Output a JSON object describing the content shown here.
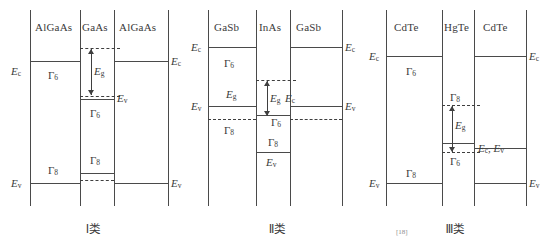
{
  "figure": {
    "line_color": "#4a4a4a",
    "dash_color": "#3f3f3f"
  },
  "panels": [
    {
      "id": "type-1",
      "caption": "Ⅰ类",
      "materials": {
        "barrier_left": "AlGaAs",
        "well": "GaAs",
        "barrier_right": "AlGaAs"
      },
      "labels": {
        "ec_left": "E",
        "ec_left_sub": "c",
        "ec_right": "E",
        "ec_right_sub": "c",
        "ev_left": "E",
        "ev_left_sub": "v",
        "ev_right": "E",
        "ev_right_sub": "v",
        "ev_well": "E",
        "ev_well_sub": "v",
        "eg": "E",
        "eg_sub": "g",
        "gamma_barrier_c": "Γ",
        "gamma_barrier_c_sub": "6",
        "gamma_well_c": "Γ",
        "gamma_well_c_sub": "6",
        "gamma_barrier_v": "Γ",
        "gamma_barrier_v_sub": "8",
        "gamma_well_v": "Γ",
        "gamma_well_v_sub": "8"
      }
    },
    {
      "id": "type-2",
      "caption": "Ⅱ类",
      "materials": {
        "barrier_left": "GaSb",
        "well": "InAs",
        "barrier_right": "GaSb"
      },
      "labels": {
        "ec_left": "E",
        "ec_left_sub": "c",
        "ec_right": "E",
        "ec_right_sub": "c",
        "ev_left": "E",
        "ev_left_sub": "v",
        "ev_right": "E",
        "ev_right_sub": "v",
        "ev_well": "E",
        "ev_well_sub": "v",
        "eg_barrier": "E",
        "eg_barrier_sub": "g",
        "eg_well": "E",
        "eg_well_sub": "g",
        "ec_well_edge": "E",
        "ec_well_edge_sub": "c",
        "gamma_barrier_c": "Γ",
        "gamma_barrier_c_sub": "6",
        "gamma_barrier_v": "Γ",
        "gamma_barrier_v_sub": "8",
        "gamma_well_c": "Γ",
        "gamma_well_c_sub": "6",
        "gamma_well_v": "Γ",
        "gamma_well_v_sub": "8"
      }
    },
    {
      "id": "type-3",
      "caption": "Ⅲ类",
      "materials": {
        "barrier_left": "CdTe",
        "well": "HgTe",
        "barrier_right": "CdTe"
      },
      "labels": {
        "ec_left": "E",
        "ec_left_sub": "c",
        "ec_right": "E",
        "ec_right_sub": "c",
        "ev_left": "E",
        "ev_left_sub": "v",
        "ev_right": "E",
        "ev_right_sub": "v",
        "ecv_right": "E",
        "ecv_right_sub": "c",
        "ecv_right_2": "E",
        "ecv_right_2_sub": "v",
        "eg": "E",
        "eg_sub": "g",
        "gamma_barrier_c": "Γ",
        "gamma_barrier_c_sub": "6",
        "gamma_barrier_v": "Γ",
        "gamma_barrier_v_sub": "8",
        "gamma_well_top": "Γ",
        "gamma_well_top_sub": "8",
        "gamma_well_bot": "Γ",
        "gamma_well_bot_sub": "6"
      }
    }
  ],
  "footnote": {
    "mark": "[18]"
  }
}
